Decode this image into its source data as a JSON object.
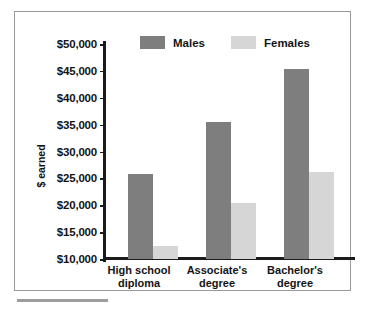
{
  "chart_data": {
    "type": "bar",
    "title": "",
    "xlabel": "",
    "ylabel": "$ earned",
    "ylim": [
      10000,
      50000
    ],
    "ytick_step": 5000,
    "grid": false,
    "legend_position": "top",
    "categories": [
      "High school diploma",
      "Associate's degree",
      "Bachelor's degree"
    ],
    "category_lines": [
      [
        "High school",
        "diploma"
      ],
      [
        "Associate's",
        "degree"
      ],
      [
        "Bachelor's",
        "degree"
      ]
    ],
    "ytick_labels": [
      "$50,000",
      "$45,000",
      "$40,000",
      "$35,000",
      "$30,000",
      "$25,000",
      "$20,000",
      "$15,000",
      "$10,000"
    ],
    "ytick_values": [
      50000,
      45000,
      40000,
      35000,
      30000,
      25000,
      20000,
      15000,
      10000
    ],
    "series": [
      {
        "name": "Males",
        "color": "#7e7e7e",
        "values": [
          25800,
          35400,
          45400
        ]
      },
      {
        "name": "Females",
        "color": "#d6d6d6",
        "values": [
          12400,
          20500,
          26200
        ]
      }
    ]
  },
  "legend": {
    "items": [
      {
        "label": "Males",
        "swatch": "male"
      },
      {
        "label": "Females",
        "swatch": "female"
      }
    ]
  }
}
